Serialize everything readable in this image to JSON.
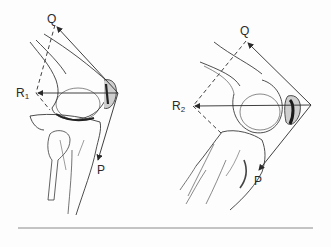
{
  "figure": {
    "colors": {
      "ink": "#2a2a2a",
      "background": "#fdfdfd",
      "rule": "#8a8a8a"
    },
    "left_knee": {
      "labels": {
        "q": "Q",
        "r": "R",
        "r_sub": "1",
        "p": "P"
      }
    },
    "right_knee": {
      "labels": {
        "q": "Q",
        "r": "R",
        "r_sub": "2",
        "p": "P"
      }
    }
  }
}
